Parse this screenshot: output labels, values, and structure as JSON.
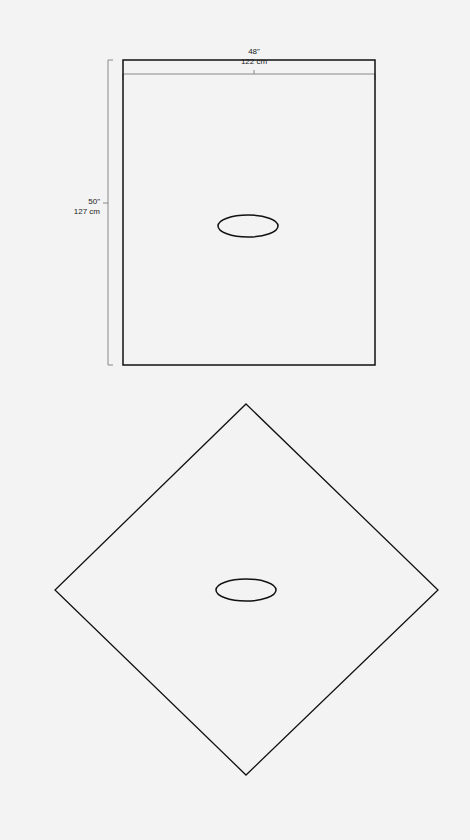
{
  "diagram": {
    "top_panel": {
      "shape": "rectangle",
      "width_label": {
        "in": "48\"",
        "cm": "122 cm"
      },
      "height_label": {
        "in": "50\"",
        "cm": "127 cm"
      },
      "center_feature": "oval-opening"
    },
    "bottom_panel": {
      "shape": "diamond",
      "center_feature": "oval-opening"
    },
    "colors": {
      "background": "#f3f3f3",
      "outline": "#111111",
      "dimension_line": "#888888"
    }
  }
}
